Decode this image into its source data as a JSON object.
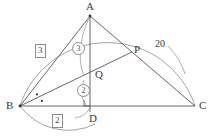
{
  "figure": {
    "type": "geometry-diagram",
    "stroke_color": "#555555",
    "arc_color": "#8d8d8d",
    "background": "#ffffff"
  },
  "vertices": {
    "A": {
      "label": "A",
      "x": 90,
      "y": 16
    },
    "B": {
      "label": "B",
      "x": 20,
      "y": 106
    },
    "C": {
      "label": "C",
      "x": 195,
      "y": 106
    },
    "D": {
      "label": "D",
      "x": 90,
      "y": 106
    },
    "P": {
      "label": "P",
      "x": 132,
      "y": 52
    },
    "Q": {
      "label": "Q",
      "x": 90,
      "y": 70
    }
  },
  "labels": {
    "side_ac_length": "20",
    "arc_left_ratio": "3",
    "arc_bottom_ratio": "2",
    "segment_aq_ratio": "3",
    "segment_qd_ratio": "2"
  },
  "marks": {
    "right_angle_at_d": "right-angle",
    "equal_angle_dots_at_b": 2
  }
}
